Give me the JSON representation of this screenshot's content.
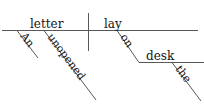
{
  "diagram": {
    "type": "reed-kellogg-sentence-diagram",
    "sentence": "An unopened letter lay on the desk.",
    "ink_color": "#141414",
    "line_color": "#58585a",
    "background_color": "#ffffff",
    "nodes": {
      "subject": "letter",
      "verb": "lay",
      "subject_modifier_1": "An",
      "subject_modifier_2": "unopened",
      "preposition": "on",
      "prep_object": "desk",
      "prep_object_modifier": "the"
    },
    "labels": {
      "subject_label": "letter",
      "verb_label": "lay",
      "modifier_an_label": "An",
      "modifier_unopened_label": "unopened",
      "preposition_label": "on",
      "object_desk_label": "desk",
      "modifier_the_label": "the"
    },
    "parts": {
      "baseline_name": "main-baseline",
      "divider_name": "subject-verb-divider",
      "prep_line_name": "prepositional-phrase-line"
    }
  }
}
